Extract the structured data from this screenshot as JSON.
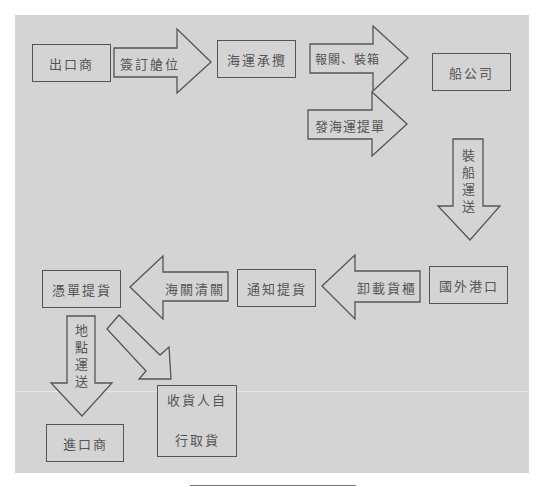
{
  "diagram": {
    "type": "flowchart",
    "background_color": "#d4d4d4",
    "stroke_color": "#555555",
    "nodes": {
      "exporter": "出口商",
      "forwarder": "海運承攬",
      "shipping_company": "船公司",
      "foreign_port": "國外港口",
      "notify_pickup": "通知提貨",
      "pickup_with_doc": "憑單提貨",
      "importer": "進口商",
      "consignee_self_pickup_line1": "收貨人自",
      "consignee_self_pickup_line2": "行取貨"
    },
    "arrows": {
      "book_space": "簽訂艙位",
      "customs_packing": "報關、裝箱",
      "issue_bl": "發海運提單",
      "ship_transport": "裝船運送",
      "unload_container": "卸載貨櫃",
      "customs_clearance": "海關清關",
      "local_delivery": "地點運送"
    },
    "edges": [
      {
        "from": "出口商",
        "to": "海運承攬",
        "label": "簽訂艙位"
      },
      {
        "from": "海運承攬",
        "to": "船公司",
        "label": "報關、裝箱"
      },
      {
        "from": "海運承攬",
        "to": "船公司",
        "label": "發海運提單"
      },
      {
        "from": "船公司",
        "to": "國外港口",
        "label": "裝船運送"
      },
      {
        "from": "國外港口",
        "to": "通知提貨",
        "label": "卸載貨櫃"
      },
      {
        "from": "通知提貨",
        "to": "憑單提貨",
        "label": "海關清關"
      },
      {
        "from": "憑單提貨",
        "to": "進口商",
        "label": "地點運送"
      },
      {
        "from": "憑單提貨",
        "to": "收貨人自行取貨",
        "label": ""
      }
    ]
  }
}
